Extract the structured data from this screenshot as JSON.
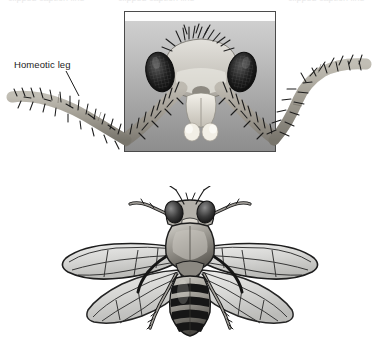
{
  "figure": {
    "title": "",
    "background_color": "#ffffff",
    "clipped_text_top": "clipped caption line",
    "annotations": [
      {
        "id": "homeotic-leg",
        "text": "Homeotic leg",
        "leader_line": true,
        "points_to": "left homeotic leg emerging from the head"
      }
    ],
    "panels": [
      {
        "id": "antennapedia-head-photo",
        "type": "photograph",
        "caption": "",
        "border_color": "#4a4a4a",
        "background": "gray gradient",
        "subject": "Drosophila head with homeotic legs in place of antennae",
        "features": [
          "compound eye left",
          "compound eye right",
          "head bristles",
          "mouthparts / labial palps",
          "homeotic leg left",
          "homeotic leg right"
        ]
      },
      {
        "id": "bithorax-four-winged-fly",
        "type": "illustration",
        "caption": "",
        "subject": "Four-winged bithorax mutant Drosophila, dorsal view",
        "features": [
          "head with compound eyes and antennae",
          "thorax",
          "forewing pair",
          "second wing pair",
          "banded abdomen",
          "six legs"
        ]
      }
    ],
    "colors": {
      "ink": "#1b1b1b",
      "panel_border": "#4a4a4a",
      "panel_light": "#cfcfcf",
      "panel_dark": "#8d8d8d",
      "leg_fill": "#b9b5ad",
      "wing_fill": "#d9d9d9",
      "body_dark": "#1d1d1d"
    }
  }
}
